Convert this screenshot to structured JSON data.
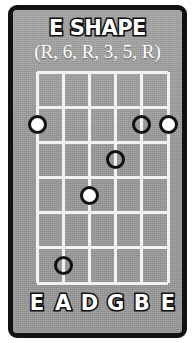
{
  "card": {
    "title": "E SHAPE",
    "subtitle": "(R, 6, R, 3, 5, R)",
    "border_color": "#111111",
    "background_color": "#9e9e9e",
    "grid_line_color": "#f2f2f2",
    "text_color": "#ffffff"
  },
  "fretboard": {
    "string_count": 6,
    "fret_count": 6,
    "string_labels": [
      "E",
      "A",
      "D",
      "G",
      "B",
      "E"
    ],
    "intervals": [
      "R",
      "6",
      "R",
      "3",
      "5",
      "R"
    ],
    "dots": [
      {
        "label": "R",
        "string": 1,
        "fret": 2,
        "style": "filled"
      },
      {
        "label": "5",
        "string": 5,
        "fret": 2,
        "style": "hollow"
      },
      {
        "label": "R",
        "string": 6,
        "fret": 2,
        "style": "filled"
      },
      {
        "label": "3",
        "string": 4,
        "fret": 3,
        "style": "hollow"
      },
      {
        "label": "R",
        "string": 3,
        "fret": 4,
        "style": "filled"
      },
      {
        "label": "6",
        "string": 2,
        "fret": 6,
        "style": "hollow"
      }
    ]
  },
  "chart_data": {
    "type": "table",
    "title": "E SHAPE",
    "subtitle": "(R, 6, R, 3, 5, R)",
    "xlabel": "String",
    "ylabel": "Fret",
    "categories": [
      "E",
      "A",
      "D",
      "G",
      "B",
      "E"
    ],
    "series": [
      {
        "name": "fret",
        "values": [
          2,
          6,
          4,
          3,
          2,
          2
        ]
      },
      {
        "name": "interval",
        "values": [
          "R",
          "6",
          "R",
          "3",
          "5",
          "R"
        ]
      },
      {
        "name": "marker",
        "values": [
          "filled",
          "hollow",
          "filled",
          "hollow",
          "hollow",
          "filled"
        ]
      }
    ]
  }
}
